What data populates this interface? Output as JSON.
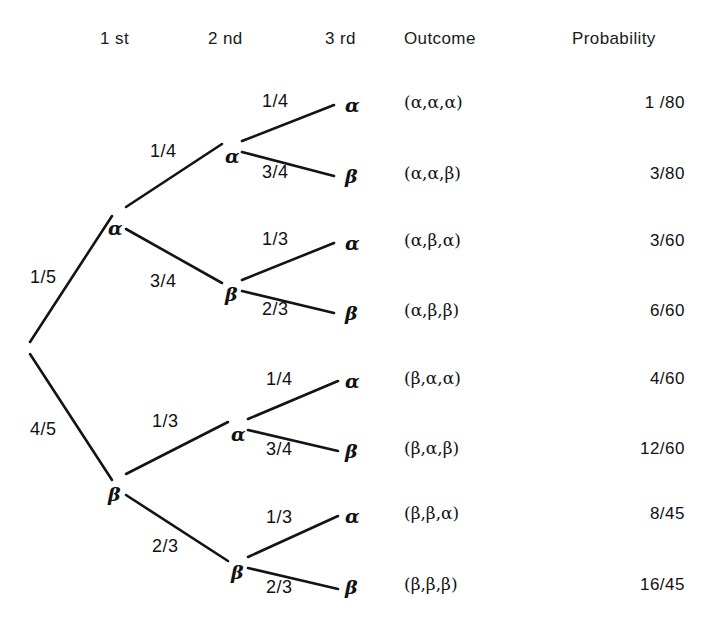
{
  "headers": [
    {
      "label": "1 st",
      "x": 100,
      "y": 30,
      "name": "column-header-first"
    },
    {
      "label": "2 nd",
      "x": 208,
      "y": 30,
      "name": "column-header-second"
    },
    {
      "label": "3 rd",
      "x": 325,
      "y": 30,
      "name": "column-header-third"
    },
    {
      "label": "Outcome",
      "x": 404,
      "y": 30,
      "name": "column-header-outcome"
    },
    {
      "label": "Probability",
      "x": 572,
      "y": 30,
      "name": "column-header-probability"
    }
  ],
  "symbols": {
    "alpha": "α",
    "beta": "β"
  },
  "colors": {
    "line": "#141414",
    "text": "#111111",
    "background": "#ffffff"
  },
  "nodes": [
    {
      "name": "root-node",
      "label": "",
      "x": 25,
      "y": 348
    },
    {
      "name": "node-alpha-level1",
      "label": "α",
      "x": 108,
      "y": 219
    },
    {
      "name": "node-beta-level1",
      "label": "β",
      "x": 108,
      "y": 485
    },
    {
      "name": "node-alpha-alpha",
      "label": "α",
      "x": 225,
      "y": 147
    },
    {
      "name": "node-alpha-beta",
      "label": "β",
      "x": 225,
      "y": 285
    },
    {
      "name": "node-beta-alpha",
      "label": "α",
      "x": 231,
      "y": 425
    },
    {
      "name": "node-beta-beta",
      "label": "β",
      "x": 231,
      "y": 563
    }
  ],
  "edges": [
    {
      "name": "edge-root-alpha",
      "label": "1/5",
      "lx": 30,
      "ly": 268,
      "x1": 30,
      "y1": 342,
      "x2": 112,
      "y2": 216
    },
    {
      "name": "edge-root-beta",
      "label": "4/5",
      "lx": 30,
      "ly": 420,
      "x1": 30,
      "y1": 354,
      "x2": 112,
      "y2": 480
    },
    {
      "name": "edge-alpha-alpha",
      "label": "1/4",
      "lx": 150,
      "ly": 142,
      "x1": 126,
      "y1": 207,
      "x2": 222,
      "y2": 144
    },
    {
      "name": "edge-alpha-beta",
      "label": "3/4",
      "lx": 150,
      "ly": 272,
      "x1": 126,
      "y1": 229,
      "x2": 222,
      "y2": 283
    },
    {
      "name": "edge-beta-alpha",
      "label": "1/3",
      "lx": 152,
      "ly": 412,
      "x1": 126,
      "y1": 474,
      "x2": 228,
      "y2": 422
    },
    {
      "name": "edge-beta-beta",
      "label": "2/3",
      "lx": 152,
      "ly": 537,
      "x1": 126,
      "y1": 495,
      "x2": 228,
      "y2": 561
    },
    {
      "name": "edge-alpha-alpha-alpha",
      "label": "1/4",
      "lx": 262,
      "ly": 92,
      "x1": 242,
      "y1": 141,
      "x2": 334,
      "y2": 105
    },
    {
      "name": "edge-alpha-alpha-beta",
      "label": "3/4",
      "lx": 262,
      "ly": 163,
      "x1": 242,
      "y1": 152,
      "x2": 334,
      "y2": 176
    },
    {
      "name": "edge-alpha-beta-alpha",
      "label": "1/3",
      "lx": 262,
      "ly": 230,
      "x1": 242,
      "y1": 280,
      "x2": 334,
      "y2": 243
    },
    {
      "name": "edge-alpha-beta-beta",
      "label": "2/3",
      "lx": 262,
      "ly": 300,
      "x1": 242,
      "y1": 291,
      "x2": 334,
      "y2": 313
    },
    {
      "name": "edge-beta-alpha-alpha",
      "label": "1/4",
      "lx": 266,
      "ly": 370,
      "x1": 248,
      "y1": 419,
      "x2": 338,
      "y2": 381
    },
    {
      "name": "edge-beta-alpha-beta",
      "label": "3/4",
      "lx": 266,
      "ly": 440,
      "x1": 248,
      "y1": 430,
      "x2": 338,
      "y2": 451
    },
    {
      "name": "edge-beta-beta-alpha",
      "label": "1/3",
      "lx": 266,
      "ly": 508,
      "x1": 248,
      "y1": 557,
      "x2": 338,
      "y2": 516
    },
    {
      "name": "edge-beta-beta-beta",
      "label": "2/3",
      "lx": 266,
      "ly": 578,
      "x1": 248,
      "y1": 568,
      "x2": 338,
      "y2": 589
    }
  ],
  "rows": [
    {
      "leaf": "α",
      "outcome": "(α,α,α)",
      "probability": "1 /80",
      "y": 96,
      "name": "row-aaa"
    },
    {
      "leaf": "β",
      "outcome": "(α,α,β)",
      "probability": "3/80",
      "y": 167,
      "name": "row-aab"
    },
    {
      "leaf": "α",
      "outcome": "(α,β,α)",
      "probability": "3/60",
      "y": 234,
      "name": "row-aba"
    },
    {
      "leaf": "β",
      "outcome": "(α,β,β)",
      "probability": "6/60",
      "y": 304,
      "name": "row-abb"
    },
    {
      "leaf": "α",
      "outcome": "(β,α,α)",
      "probability": "4/60",
      "y": 372,
      "name": "row-baa"
    },
    {
      "leaf": "β",
      "outcome": "(β,α,β)",
      "probability": "12/60",
      "y": 442,
      "name": "row-bab"
    },
    {
      "leaf": "α",
      "outcome": "(β,β,α)",
      "probability": "8/45",
      "y": 507,
      "name": "row-bba"
    },
    {
      "leaf": "β",
      "outcome": "(β,β,β)",
      "probability": "16/45",
      "y": 578,
      "name": "row-bbb"
    }
  ],
  "layout": {
    "leaf_x": 345,
    "outcome_x": 404,
    "probability_right": 685
  },
  "caption": {
    "text": "",
    "y": 626
  }
}
